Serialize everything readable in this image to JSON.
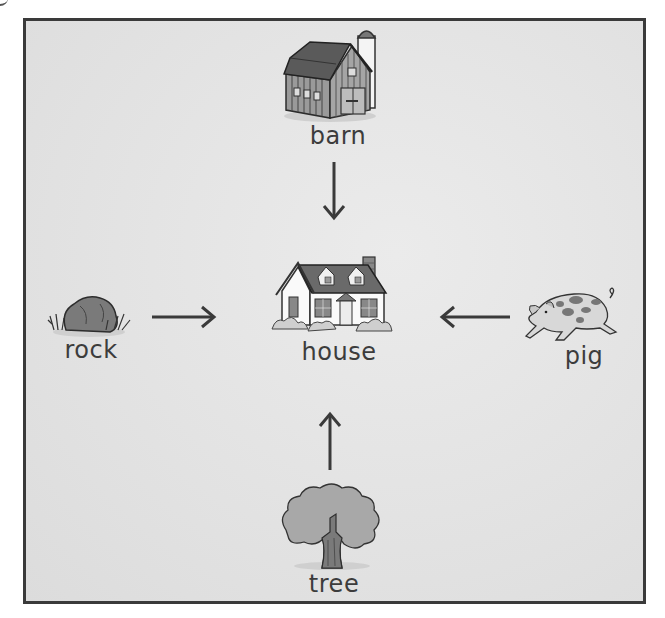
{
  "diagram": {
    "type": "food-web-style arrow diagram",
    "center": {
      "id": "house",
      "label": "house",
      "icon": "house-icon"
    },
    "nodes": [
      {
        "id": "barn",
        "label": "barn",
        "icon": "barn-icon",
        "position": "top"
      },
      {
        "id": "rock",
        "label": "rock",
        "icon": "rock-icon",
        "position": "left"
      },
      {
        "id": "pig",
        "label": "pig",
        "icon": "pig-icon",
        "position": "right"
      },
      {
        "id": "tree",
        "label": "tree",
        "icon": "tree-icon",
        "position": "bottom"
      }
    ],
    "edges": [
      {
        "from": "barn",
        "to": "house",
        "direction": "down"
      },
      {
        "from": "rock",
        "to": "house",
        "direction": "right"
      },
      {
        "from": "pig",
        "to": "house",
        "direction": "left"
      },
      {
        "from": "tree",
        "to": "house",
        "direction": "up"
      }
    ]
  },
  "colors": {
    "background": "#e4e4e4",
    "border": "#3a3a3a",
    "text": "#3c3c3c",
    "arrow": "#3a3a3a"
  }
}
